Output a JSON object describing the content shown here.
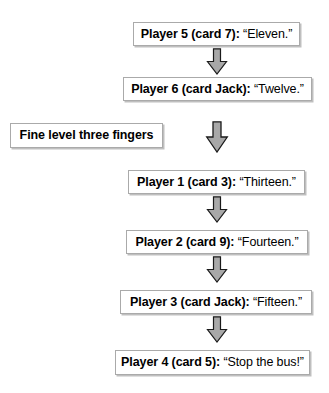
{
  "diagram": {
    "background": "#ffffff",
    "box_border_color": "#aaaaaa",
    "box_shadow_color": "#bfbfbf",
    "arrow_fill_color": "#a8a8a8",
    "arrow_outline_color": "#1a1a1a",
    "text_color": "#000000"
  },
  "side_note": {
    "text": "Fine level three fingers"
  },
  "nodes": [
    {
      "who": "Player 5 (card 7):",
      "says": "“Eleven.”"
    },
    {
      "who": "Player 6 (card Jack):",
      "says": "“Twelve.”"
    },
    {
      "who": "Player 1 (card 3):",
      "says": "“Thirteen.”"
    },
    {
      "who": "Player 2 (card 9):",
      "says": "“Fourteen.”"
    },
    {
      "who": "Player 3 (card Jack):",
      "says": "“Fifteen.”"
    },
    {
      "who": "Player 4 (card 5):",
      "says": "“Stop the bus!”"
    }
  ],
  "arrows": [
    {
      "name": "arrow-player5-to-player6"
    },
    {
      "name": "arrow-player6-to-player1"
    },
    {
      "name": "arrow-player1-to-player2"
    },
    {
      "name": "arrow-player2-to-player3"
    },
    {
      "name": "arrow-player3-to-player4"
    }
  ]
}
